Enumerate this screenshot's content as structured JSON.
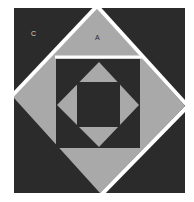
{
  "figure": {
    "title": "",
    "colors": {
      "background": "#ffffff",
      "dark": "#2b2b2b",
      "light": "#a9a9a9",
      "stripe": "#ffffff"
    },
    "labels": {
      "c": "C",
      "a": "A"
    }
  }
}
